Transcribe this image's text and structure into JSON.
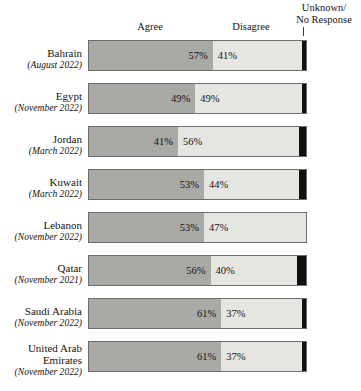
{
  "chart_data": {
    "type": "bar",
    "title": "",
    "subtitle": "",
    "orientation": "horizontal",
    "stacked": true,
    "xlabel": "",
    "ylabel": "",
    "xlim": [
      0,
      100
    ],
    "grid": false,
    "legend_position": "top",
    "categories": [
      "Bahrain",
      "Egypt",
      "Jordan",
      "Kuwait",
      "Lebanon",
      "Qatar",
      "Saudi Arabia",
      "United Arab Emirates"
    ],
    "category_dates": [
      "(August 2022)",
      "(November 2022)",
      "(March 2022)",
      "(March 2022)",
      "(November 2022)",
      "(November 2021)",
      "(November 2022)",
      "(November 2022)"
    ],
    "series": [
      {
        "name": "Agree",
        "values": [
          57,
          49,
          41,
          53,
          53,
          56,
          61,
          61
        ]
      },
      {
        "name": "Disagree",
        "values": [
          41,
          49,
          56,
          44,
          47,
          40,
          37,
          37
        ]
      },
      {
        "name": "Unknown/ No Response",
        "values": [
          2,
          2,
          3,
          3,
          0,
          4,
          2,
          2
        ]
      }
    ],
    "colors": {
      "agree": "#a9a9a6",
      "disagree": "#e5e5e2",
      "unknown": "#111111",
      "border": "#6e6e6e",
      "text": "#16140f"
    }
  },
  "headers": {
    "agree": "Agree",
    "disagree": "Disagree",
    "unknown": "Unknown/\nNo Response"
  },
  "rows": [
    {
      "country": "Bahrain",
      "date": "(August 2022)",
      "agree": 57,
      "disagree": 41,
      "unknown": 2,
      "agree_label": "57%",
      "disagree_label": "41%"
    },
    {
      "country": "Egypt",
      "date": "(November 2022)",
      "agree": 49,
      "disagree": 49,
      "unknown": 2,
      "agree_label": "49%",
      "disagree_label": "49%"
    },
    {
      "country": "Jordan",
      "date": "(March 2022)",
      "agree": 41,
      "disagree": 56,
      "unknown": 3,
      "agree_label": "41%",
      "disagree_label": "56%"
    },
    {
      "country": "Kuwait",
      "date": "(March 2022)",
      "agree": 53,
      "disagree": 44,
      "unknown": 3,
      "agree_label": "53%",
      "disagree_label": "44%"
    },
    {
      "country": "Lebanon",
      "date": "(November 2022)",
      "agree": 53,
      "disagree": 47,
      "unknown": 0,
      "agree_label": "53%",
      "disagree_label": "47%"
    },
    {
      "country": "Qatar",
      "date": "(November 2021)",
      "agree": 56,
      "disagree": 40,
      "unknown": 4,
      "agree_label": "56%",
      "disagree_label": "40%"
    },
    {
      "country": "Saudi Arabia",
      "date": "(November 2022)",
      "agree": 61,
      "disagree": 37,
      "unknown": 2,
      "agree_label": "61%",
      "disagree_label": "37%"
    },
    {
      "country": "United Arab Emirates",
      "date": "(November 2022)",
      "agree": 61,
      "disagree": 37,
      "unknown": 2,
      "agree_label": "61%",
      "disagree_label": "37%"
    }
  ]
}
